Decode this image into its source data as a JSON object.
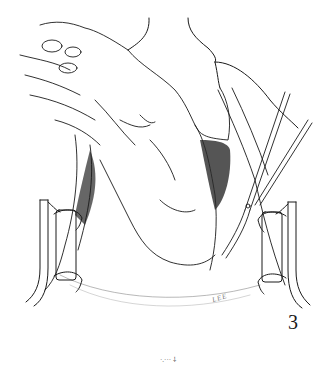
{
  "figure": {
    "number": "3",
    "signature": "LEE",
    "colors": {
      "ink": "#1a1a1a",
      "background": "#ffffff"
    }
  },
  "footer_mark": "·.··· ⸸"
}
